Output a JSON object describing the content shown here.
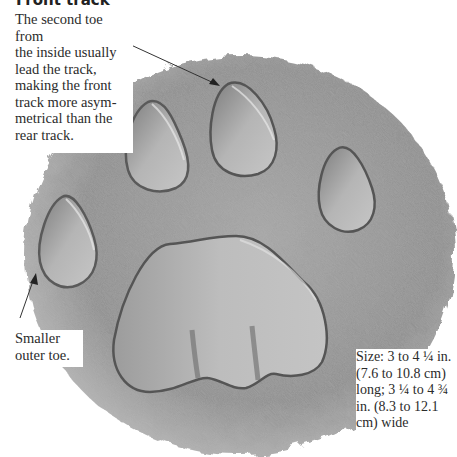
{
  "figure": {
    "title": "Front track",
    "colors": {
      "background": "#ffffff",
      "substrate": "#9a9a9a",
      "substrate_dark": "#6f6f6f",
      "pad": "#b4b4b4",
      "pad_shadow": "#555555",
      "text": "#2b2b2b",
      "arrow": "#333333"
    }
  },
  "annotations": {
    "lead_toe": "The second toe from\nthe inside usually\nlead the track,\nmaking the front\ntrack more asym-\nmetrical than the\nrear track.",
    "outer_toe": "Smaller\nouter toe.",
    "size": "Size:  3 to 4 ¼ in.\n(7.6 to 10.8 cm)\nlong; 3 ¼ to 4 ¾\nin. (8.3 to 12.1\ncm) wide"
  }
}
